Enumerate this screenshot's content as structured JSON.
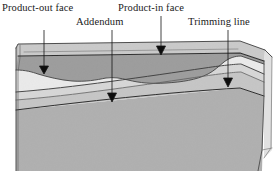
{
  "figure": {
    "name": "die-face-cross-section",
    "background_color": "#ffffff",
    "labels": [
      {
        "id": "product-out-face",
        "text": "Product-out face",
        "leader": {
          "x": 44,
          "y_start": 30,
          "y_end": 66,
          "arrow_tip_y": 73
        }
      },
      {
        "id": "addendum",
        "text": "Addendum",
        "leader": {
          "x": 112,
          "y_start": 30,
          "y_end": 93,
          "arrow_tip_y": 101
        }
      },
      {
        "id": "product-in-face",
        "text": "Product-in face",
        "leader": {
          "x": 161,
          "y_start": 16,
          "y_end": 46,
          "arrow_tip_y": 54
        }
      },
      {
        "id": "trimming-line",
        "text": "Trimming line",
        "leader": {
          "x": 228,
          "y_start": 30,
          "y_end": 78,
          "arrow_tip_y": 86
        }
      }
    ],
    "colors": {
      "top_face": "#c9c9c9",
      "upper_band": "#9d9d9d",
      "product_surface": "#ebebeb",
      "mid_light": "#e2e2e2",
      "mid_gray": "#cfcfcf",
      "lower_gray": "#b6b6b6",
      "bottom_gray": "#b0b0b0",
      "outline": "#3a3a3a",
      "thin_line": "#5a5a5a",
      "arrow": "#111111",
      "label_text": "#1a1a1a"
    },
    "regions": [
      {
        "id": "top-face",
        "description": "Light gray upper plan surface of the die"
      },
      {
        "id": "product-out-face",
        "description": "Darker gray band below the top face"
      },
      {
        "id": "addendum-surface",
        "description": "Light wavy addendum region in the middle"
      },
      {
        "id": "product-in-face",
        "description": "Inner product face along the top edge"
      },
      {
        "id": "trimming-line",
        "description": "Step contour on the right side"
      },
      {
        "id": "lower-flank",
        "description": "Sloping lower gray bands"
      },
      {
        "id": "bottom-block",
        "description": "Large medium-gray base block"
      }
    ]
  }
}
